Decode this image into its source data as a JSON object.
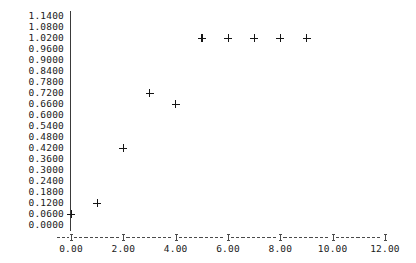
{
  "chart_data": {
    "type": "scatter",
    "title": "",
    "subtitle": "",
    "xlabel": "",
    "ylabel": "",
    "marker": "+",
    "marker_color": "#151515",
    "grid": false,
    "legend": null,
    "legend_position": "none",
    "xlim": [
      0.0,
      12.0
    ],
    "ylim": [
      0.0,
      1.14
    ],
    "x_tick_labels": [
      "0.00",
      "2.00",
      "4.00",
      "6.00",
      "8.00",
      "10.00",
      "12.00"
    ],
    "x_tick_values": [
      0.0,
      2.0,
      4.0,
      6.0,
      8.0,
      10.0,
      12.0
    ],
    "x_tick_step": 2.0,
    "y_tick_labels": [
      "1.1400",
      "1.0800",
      "1.0200",
      "0.9600",
      "0.9000",
      "0.8400",
      "0.7800",
      "0.7200",
      "0.6600",
      "0.6000",
      "0.5400",
      "0.4800",
      "0.4200",
      "0.3600",
      "0.3000",
      "0.2400",
      "0.1800",
      "0.1200",
      "0.0600",
      "0.0000"
    ],
    "y_tick_values": [
      1.14,
      1.08,
      1.02,
      0.96,
      0.9,
      0.84,
      0.78,
      0.72,
      0.66,
      0.6,
      0.54,
      0.48,
      0.42,
      0.36,
      0.3,
      0.24,
      0.18,
      0.12,
      0.06,
      0.0
    ],
    "y_tick_step": 0.06,
    "x": [
      0,
      1,
      2,
      3,
      4,
      5,
      6,
      7,
      8,
      9
    ],
    "y": [
      0.06,
      0.12,
      0.42,
      0.72,
      0.66,
      1.02,
      1.02,
      1.02,
      1.02,
      1.02
    ],
    "points": [
      {
        "x": 0,
        "y": 0.06
      },
      {
        "x": 1,
        "y": 0.12
      },
      {
        "x": 2,
        "y": 0.42
      },
      {
        "x": 3,
        "y": 0.72
      },
      {
        "x": 4,
        "y": 0.66
      },
      {
        "x": 5,
        "y": 1.02
      },
      {
        "x": 6,
        "y": 1.02
      },
      {
        "x": 7,
        "y": 1.02
      },
      {
        "x": 8,
        "y": 1.02
      },
      {
        "x": 9,
        "y": 1.02
      }
    ]
  },
  "axes": {
    "y_axis_style": "solid-pipe-column",
    "x_axis_style": "dashed-rule-with-plus-ticks"
  }
}
